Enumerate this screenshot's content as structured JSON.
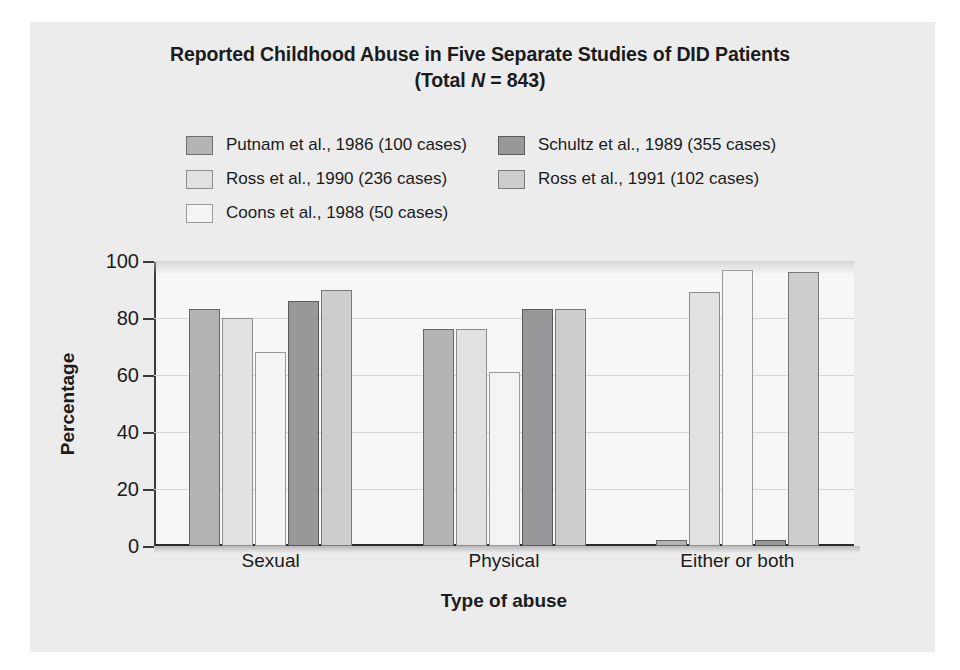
{
  "chart_data": {
    "type": "bar",
    "title": "Reported Childhood Abuse in Five Separate Studies of DID Patients",
    "subtitle": "(Total N = 843)",
    "subtitle_prefix": "(Total ",
    "subtitle_italic": "N",
    "subtitle_suffix": " = 843)",
    "xlabel": "Type of abuse",
    "ylabel": "Percentage",
    "categories": [
      "Sexual",
      "Physical",
      "Either or both"
    ],
    "ylim": [
      0,
      100
    ],
    "yticks": [
      0,
      20,
      40,
      60,
      80,
      100
    ],
    "ytick_labels": [
      "0",
      "20",
      "40",
      "60",
      "80",
      "100"
    ],
    "grid": "horizontal",
    "legend_position": "above-plot",
    "series": [
      {
        "name": "Putnam et al., 1986 (100 cases)",
        "color": "#b4b4b5",
        "border": "#676768",
        "values": [
          83,
          76,
          2
        ]
      },
      {
        "name": "Ross et al., 1990 (236 cases)",
        "color": "#e2e2e2",
        "border": "#8d8d8e",
        "values": [
          80,
          76,
          89
        ]
      },
      {
        "name": "Coons et al., 1988 (50 cases)",
        "color": "#f4f4f4",
        "border": "#9a9a9b",
        "values": [
          68,
          61,
          97
        ]
      },
      {
        "name": "Schultz et al., 1989 (355 cases)",
        "color": "#98989a",
        "border": "#5a5a5b",
        "values": [
          86,
          83,
          2
        ]
      },
      {
        "name": "Ross et al., 1991 (102 cases)",
        "color": "#cdcdce",
        "border": "#787879",
        "values": [
          90,
          83,
          96
        ]
      }
    ]
  },
  "legend": {
    "rows": [
      [
        {
          "label": "Putnam et al., 1986 (100 cases)",
          "color": "#b4b4b5",
          "border": "#6f6f70"
        },
        {
          "label": "Schultz et al., 1989 (355 cases)",
          "color": "#98989a",
          "border": "#5a5a5b"
        }
      ],
      [
        {
          "label": "Ross et al., 1990 (236 cases)",
          "color": "#e2e2e2",
          "border": "#8d8d8e"
        },
        {
          "label": "Ross et al., 1991 (102 cases)",
          "color": "#cdcdce",
          "border": "#787879"
        }
      ],
      [
        {
          "label": "Coons et al., 1988 (50 cases)",
          "color": "#f4f4f4",
          "border": "#9a9a9b"
        }
      ]
    ]
  },
  "colors": {
    "page_background": "#ffffff",
    "panel_background": "#ececed",
    "plot_background": "#f7f7f7",
    "axis": "#2a2a2a",
    "gridline": "#d6d6d6",
    "text": "#1b1b1b"
  }
}
